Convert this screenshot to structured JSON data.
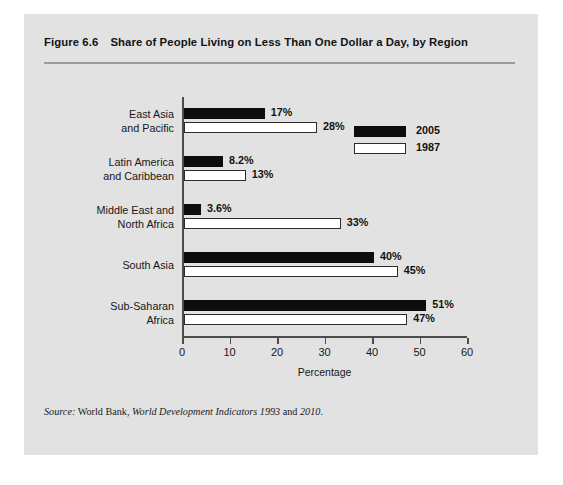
{
  "figure": {
    "number": "Figure 6.6",
    "title": "Share of People Living on Less Than One Dollar a Day, by Region",
    "source_label": "Source:",
    "source_text_1": " World Bank, ",
    "source_publication": "World Development Indicators 1993",
    "source_text_2": " and ",
    "source_year": "2010",
    "source_end": "."
  },
  "legend": {
    "items": [
      {
        "label": "2005",
        "series": "s2005",
        "color": "#0d0d0d"
      },
      {
        "label": "1987",
        "series": "s1987",
        "color": "#ffffff"
      }
    ]
  },
  "chart_data": {
    "type": "bar",
    "orientation": "horizontal",
    "title": "Share of People Living on Less Than One Dollar a Day, by Region",
    "xlabel": "Percentage",
    "ylabel": "",
    "xlim": [
      0,
      60
    ],
    "xticks": [
      0,
      10,
      20,
      30,
      40,
      50,
      60
    ],
    "xtick_labels": [
      "0",
      "10",
      "20",
      "30",
      "40",
      "50",
      "60"
    ],
    "grid": false,
    "legend_position": "upper right",
    "categories": [
      "East Asia and Pacific",
      "Latin America and Caribbean",
      "Middle East and North Africa",
      "South Asia",
      "Sub-Saharan Africa"
    ],
    "category_lines": [
      [
        "East Asia",
        "and Pacific"
      ],
      [
        "Latin America",
        "and Caribbean"
      ],
      [
        "Middle East and",
        "North Africa"
      ],
      [
        "South Asia",
        ""
      ],
      [
        "Sub-Saharan",
        "Africa"
      ]
    ],
    "series": [
      {
        "name": "2005",
        "color": "#0d0d0d",
        "values": [
          17,
          8.2,
          3.6,
          40,
          51
        ],
        "data_labels": [
          "17%",
          "8.2%",
          "3.6%",
          "40%",
          "51%"
        ]
      },
      {
        "name": "1987",
        "color": "#ffffff",
        "values": [
          28,
          13,
          33,
          45,
          47
        ],
        "data_labels": [
          "28%",
          "13%",
          "33%",
          "45%",
          "47%"
        ]
      }
    ]
  }
}
